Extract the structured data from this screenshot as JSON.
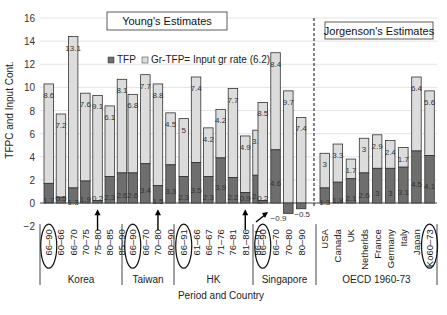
{
  "chart_data": {
    "type": "bar",
    "stacked": true,
    "title": "",
    "xlabel": "Period and Country",
    "ylabel": "TFPC and Input Cont.",
    "ylim": [
      -2,
      16
    ],
    "yticks": [
      -2,
      0,
      2,
      4,
      6,
      8,
      10,
      12,
      14,
      16
    ],
    "grid": true,
    "legend": {
      "position": "top-left-inside",
      "entries": [
        {
          "name": "TFP",
          "color": "#6e6e6e"
        },
        {
          "name": "Gr-TFP= Input gr rate (6.2)",
          "color": "#dcdcdc"
        }
      ]
    },
    "annotations": [
      {
        "text": "Young's Estimates",
        "type": "boxed-title"
      },
      {
        "text": "Jorgenson's Estimates",
        "type": "boxed-title"
      }
    ],
    "groups": [
      {
        "name": "Korea",
        "source": "Young",
        "bars": [
          {
            "label": "66-90",
            "circled": true,
            "tfp": 1.7,
            "input": 8.6
          },
          {
            "label": "60-66",
            "tfp": 0.5,
            "input": 7.2
          },
          {
            "label": "66-70",
            "tfp": 1.3,
            "input": 13.1
          },
          {
            "label": "70-75",
            "tfp": 1.9,
            "input": 7.6
          },
          {
            "label": "75-80",
            "tfp": 0.2,
            "input": 9.1,
            "arrow": true
          },
          {
            "label": "80-85",
            "tfp": 2.3,
            "input": 6.1
          },
          {
            "label": "85-90",
            "tfp": 2.6,
            "input": 8.1
          }
        ]
      },
      {
        "name": "Taiwan",
        "source": "Young",
        "bars": [
          {
            "label": "66-90",
            "circled": true,
            "tfp": 2.6,
            "input": 6.8
          },
          {
            "label": "66-70",
            "tfp": 3.4,
            "input": 7.7
          },
          {
            "label": "70-80",
            "tfp": 1.5,
            "input": 8.8,
            "arrow": true
          },
          {
            "label": "80-90",
            "tfp": 3.3,
            "input": 4.5
          }
        ]
      },
      {
        "name": "HK",
        "source": "Young",
        "bars": [
          {
            "label": "66-91",
            "circled": true,
            "tfp": 2.3,
            "input": 5
          },
          {
            "label": "61-66",
            "tfp": 3.5,
            "input": 7.4
          },
          {
            "label": "66-67",
            "tfp": 2.3,
            "input": 4.2
          },
          {
            "label": "71-76",
            "tfp": 3.9,
            "input": 4.2
          },
          {
            "label": "76-81",
            "tfp": 2.2,
            "input": 7.7
          },
          {
            "label": "81-86",
            "tfp": 0.9,
            "input": 4.9,
            "arrow": true
          },
          {
            "label": "86-91",
            "tfp": 2.4,
            "input": 3.9
          }
        ]
      },
      {
        "name": "Singapore",
        "source": "Young",
        "bars": [
          {
            "label": "66-90",
            "circled": true,
            "tfp": 0.2,
            "input": 8.5
          },
          {
            "label": "66-70",
            "tfp": 4.6,
            "input": 8.4
          },
          {
            "label": "70-80",
            "tfp": -0.9,
            "input": 9.7,
            "arrow": true
          },
          {
            "label": "80-90",
            "tfp": -0.5,
            "input": 7.4
          }
        ]
      },
      {
        "name": "OECD  1960-73",
        "source": "Jorgenson",
        "bars": [
          {
            "label": "USA",
            "tfp": 1.3,
            "input": 3
          },
          {
            "label": "Canada",
            "tfp": 1.8,
            "input": 3.3
          },
          {
            "label": "UK",
            "tfp": 2.1,
            "input": 1.7
          },
          {
            "label": "Netherlds",
            "tfp": 2.6,
            "input": 3
          },
          {
            "label": "France",
            "tfp": 3,
            "input": 2.9
          },
          {
            "label": "Germany",
            "tfp": 3,
            "input": 2.4
          },
          {
            "label": "Italy",
            "tfp": 3.1,
            "input": 1.7
          },
          {
            "label": "Japan",
            "tfp": 4.5,
            "input": 6.4
          },
          {
            "label": "Ko60-73",
            "circled": true,
            "tfp": 4.1,
            "input": 5.6
          }
        ]
      }
    ]
  },
  "labels": {
    "young_title": "Young's Estimates",
    "jorgenson_title": "Jorgenson's Estimates",
    "legend_tfp": "TFP",
    "legend_input": "Gr-TFP= Input gr rate (6.2)",
    "xlabel": "Period and Country",
    "ylabel": "TFPC and Input Cont."
  },
  "colors": {
    "tfp": "#6e6e6e",
    "input": "#dcdcdc",
    "outline": "#333333",
    "grid": "#e4e4e4"
  }
}
